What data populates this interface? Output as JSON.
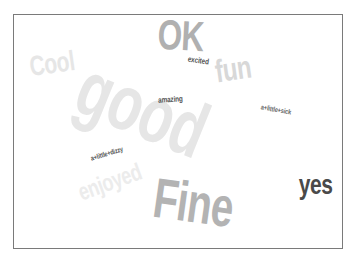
{
  "word_cloud": {
    "words": [
      {
        "text": "good",
        "color": "#e6e6e6",
        "size": 78,
        "x": 36,
        "y": 55,
        "rotate": 22,
        "scaleX": 0.72
      },
      {
        "text": "Cool",
        "color": "#e6e6e6",
        "size": 28,
        "x": 8,
        "y": 35,
        "rotate": -8,
        "scaleX": 0.75
      },
      {
        "text": "enjoyed",
        "color": "#ececec",
        "size": 24,
        "x": 52,
        "y": 155,
        "rotate": -20,
        "scaleX": 0.75
      },
      {
        "text": "OK",
        "color": "#b0b0b0",
        "size": 42,
        "x": 136,
        "y": 0,
        "rotate": 3,
        "scaleX": 0.75
      },
      {
        "text": "fun",
        "color": "#d8d8d8",
        "size": 32,
        "x": 195,
        "y": 38,
        "rotate": -8,
        "scaleX": 0.75
      },
      {
        "text": "excited",
        "color": "#555555",
        "size": 8,
        "x": 171,
        "y": 42,
        "rotate": 8,
        "scaleX": 0.8
      },
      {
        "text": "amazing",
        "color": "#555555",
        "size": 8,
        "x": 141,
        "y": 81,
        "rotate": -3,
        "scaleX": 0.8
      },
      {
        "text": "a+little+sick",
        "color": "#666666",
        "size": 7,
        "x": 243,
        "y": 91,
        "rotate": 10,
        "scaleX": 0.8
      },
      {
        "text": "a+little+dizzy",
        "color": "#555555",
        "size": 7,
        "x": 72,
        "y": 135,
        "rotate": -17,
        "scaleX": 0.8
      },
      {
        "text": "Fine",
        "color": "#b3b3b3",
        "size": 56,
        "x": 124,
        "y": 160,
        "rotate": 8,
        "scaleX": 0.72
      },
      {
        "text": "yes",
        "color": "#4a4a4a",
        "size": 28,
        "x": 279,
        "y": 156,
        "rotate": 0,
        "scaleX": 0.75
      }
    ]
  }
}
